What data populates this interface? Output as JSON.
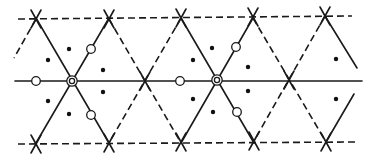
{
  "diagram": {
    "title": "",
    "colors": {
      "line": "#1a1a1a",
      "background": "#ffffff"
    },
    "lines": {
      "solid": [
        [
          15,
          81,
          362,
          81
        ],
        [
          36,
          18,
          109,
          143
        ],
        [
          109,
          18,
          36,
          143
        ],
        [
          181,
          18,
          254,
          143
        ],
        [
          253,
          18,
          181,
          143
        ],
        [
          325,
          16,
          357,
          68
        ],
        [
          326,
          142,
          354,
          94
        ]
      ],
      "dashed": [
        [
          18,
          19,
          352,
          16
        ],
        [
          18,
          144,
          356,
          142
        ],
        [
          36,
          19,
          14,
          58
        ],
        [
          109,
          19,
          181,
          143
        ],
        [
          181,
          18,
          109,
          143
        ],
        [
          253,
          18,
          326,
          142
        ],
        [
          325,
          16,
          254,
          141
        ]
      ],
      "x_marks": [
        [
          36,
          19
        ],
        [
          109,
          19
        ],
        [
          181,
          18
        ],
        [
          253,
          17
        ],
        [
          325,
          16
        ],
        [
          36,
          144
        ],
        [
          109,
          143
        ],
        [
          181,
          142
        ],
        [
          254,
          141
        ],
        [
          326,
          142
        ],
        [
          145,
          81
        ],
        [
          289,
          80
        ]
      ]
    },
    "double_circles": [
      [
        72,
        81
      ],
      [
        217,
        80
      ]
    ],
    "open_circles": [
      [
        36,
        81
      ],
      [
        91,
        49
      ],
      [
        91,
        115
      ],
      [
        180,
        81
      ],
      [
        236,
        47
      ],
      [
        237,
        112
      ]
    ],
    "dots": [
      [
        48,
        60
      ],
      [
        69,
        49
      ],
      [
        103,
        70
      ],
      [
        103,
        92
      ],
      [
        69,
        114
      ],
      [
        48,
        101
      ],
      [
        193,
        60
      ],
      [
        212,
        48
      ],
      [
        248,
        67
      ],
      [
        248,
        91
      ],
      [
        213,
        112
      ],
      [
        193,
        99
      ],
      [
        336,
        59
      ],
      [
        336,
        99
      ]
    ]
  }
}
